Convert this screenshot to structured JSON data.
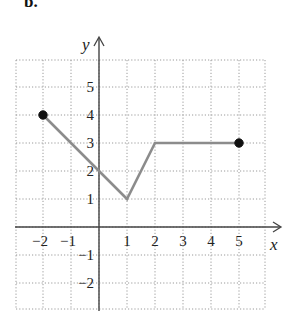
{
  "figure": {
    "part_label": "b."
  },
  "chart_data": {
    "type": "line",
    "title": "",
    "xlabel": "x",
    "ylabel": "y",
    "xlim": [
      -3,
      6
    ],
    "ylim": [
      -3,
      6
    ],
    "grid": true,
    "grid_style": "dotted",
    "x_ticks": [
      -2,
      -1,
      1,
      2,
      3,
      4,
      5
    ],
    "x_tick_labels": [
      "−2",
      "−1",
      "1",
      "2",
      "3",
      "4",
      "5"
    ],
    "y_ticks": [
      -2,
      -1,
      1,
      2,
      3,
      4,
      5
    ],
    "y_tick_labels": [
      "−2",
      "−1",
      "1",
      "2",
      "3",
      "4",
      "5"
    ],
    "series": [
      {
        "name": "piecewise linear graph",
        "x": [
          -2,
          1,
          2,
          5
        ],
        "y": [
          4,
          1,
          3,
          3
        ],
        "color": "#8c8c8c",
        "endpoints": [
          {
            "x": -2,
            "y": 4,
            "style": "closed"
          },
          {
            "x": 5,
            "y": 3,
            "style": "closed"
          }
        ]
      }
    ],
    "y_intercept": {
      "x": 0,
      "y": 2
    }
  }
}
